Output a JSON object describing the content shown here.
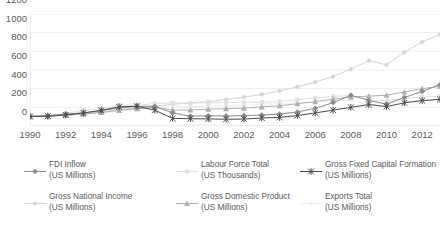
{
  "chart_data": {
    "type": "line",
    "title": "",
    "xlabel": "",
    "ylabel": "",
    "ylim": [
      0,
      1200
    ],
    "xlim": [
      1990,
      2013
    ],
    "ytick_step": 200,
    "yticks": [
      0,
      200,
      400,
      600,
      800,
      1000,
      1200
    ],
    "xticks": [
      1990,
      1992,
      1994,
      1996,
      1998,
      2000,
      2002,
      2004,
      2006,
      2008,
      2010,
      2012
    ],
    "x": [
      1990,
      1991,
      1992,
      1993,
      1994,
      1995,
      1996,
      1997,
      1998,
      1999,
      2000,
      2001,
      2002,
      2003,
      2004,
      2005,
      2006,
      2007,
      2008,
      2009,
      2010,
      2011,
      2012,
      2013
    ],
    "grid": true,
    "legend_position": "bottom",
    "series": [
      {
        "name": "FDI Inflow",
        "unit": "(US Millions)",
        "color": "#8c8c8c",
        "marker": "diamond",
        "values": [
          105,
          110,
          128,
          140,
          165,
          195,
          210,
          212,
          140,
          105,
          110,
          108,
          112,
          118,
          128,
          150,
          190,
          250,
          330,
          275,
          235,
          305,
          370,
          445
        ]
      },
      {
        "name": "Labour Force Total",
        "unit": "(US Thousands)",
        "color": "#e0e0e0",
        "marker": "square",
        "values": [
          100,
          112,
          135,
          170,
          185,
          225,
          222,
          240,
          248,
          245,
          250,
          252,
          252,
          255,
          262,
          280,
          300,
          318,
          325,
          282,
          272,
          296,
          310,
          320
        ]
      },
      {
        "name": "Gross Fixed Capital Formation",
        "unit": "(US Millions)",
        "color": "#4a4a4a",
        "marker": "star",
        "values": [
          102,
          105,
          118,
          140,
          168,
          205,
          212,
          170,
          82,
          78,
          76,
          72,
          74,
          86,
          92,
          112,
          140,
          170,
          200,
          230,
          208,
          248,
          272,
          285
        ]
      },
      {
        "name": "Gross National Income",
        "unit": "(US Millions)",
        "color": "#d4d4d4",
        "marker": "circle",
        "values": [
          98,
          108,
          120,
          135,
          152,
          178,
          196,
          214,
          232,
          248,
          262,
          285,
          310,
          338,
          375,
          420,
          470,
          530,
          610,
          700,
          655,
          790,
          900,
          980
        ]
      },
      {
        "name": "Gross Domestic Product",
        "unit": "(US Millions)",
        "color": "#b0b0b0",
        "marker": "triangle",
        "values": [
          100,
          106,
          116,
          128,
          145,
          168,
          186,
          200,
          170,
          172,
          180,
          186,
          192,
          205,
          218,
          238,
          262,
          288,
          310,
          320,
          330,
          365,
          400,
          425
        ]
      },
      {
        "name": "Exports Total",
        "unit": "(US Millions)",
        "color": "#ededed",
        "marker": "circle",
        "values": [
          96,
          104,
          114,
          126,
          140,
          160,
          178,
          192,
          200,
          206,
          212,
          218,
          224,
          232,
          240,
          250,
          258,
          268,
          276,
          230,
          250,
          262,
          276,
          288
        ]
      }
    ]
  },
  "axes": {
    "y_tick_labels": [
      "1200",
      "1000",
      "800",
      "600",
      "400",
      "200",
      "0"
    ],
    "x_tick_labels": [
      "1990",
      "1992",
      "1994",
      "1996",
      "1998",
      "2000",
      "2002",
      "2004",
      "2006",
      "2008",
      "2010",
      "2012"
    ]
  },
  "legend": {
    "entries": [
      {
        "label": "FDI Inflow",
        "unit": "(US Millions)"
      },
      {
        "label": "Labour Force Total",
        "unit": "(US Thousands)"
      },
      {
        "label": "Gross Fixed Capital Formation",
        "unit": "(US Millions)"
      },
      {
        "label": "Gross National Income",
        "unit": "(US Millions)"
      },
      {
        "label": "Gross Domestic Product",
        "unit": "(US Millions)"
      },
      {
        "label": "Exports Total",
        "unit": "(US Millions)"
      }
    ]
  },
  "style": {
    "grid_color": "#eceef1",
    "axis_color": "#d9d9d9",
    "text_color": "#595959",
    "background": "#ffffff"
  }
}
